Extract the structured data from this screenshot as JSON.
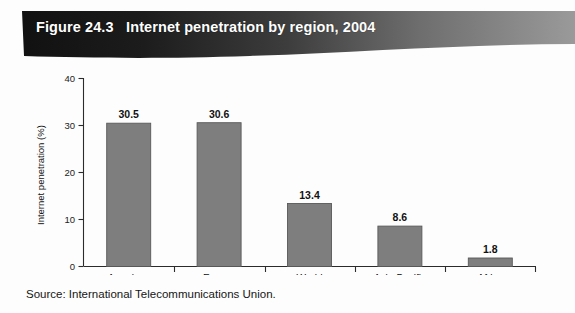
{
  "figure": {
    "banner_title": "Figure 24.3   Internet penetration by region, 2004",
    "source_note": "Source: International Telecommunications Union.",
    "banner_color_dark": "#171717",
    "banner_color_light": "#8e8e8e",
    "bar_fill": "#7f7e7f",
    "bar_stroke": "#5a595a",
    "axis_color": "#2b2b2b",
    "page_background": "#fdfdfd"
  },
  "chart_data": {
    "type": "bar",
    "title": "Internet penetration by region, 2004",
    "categories": [
      "Americas",
      "Europe",
      "World",
      "Asia-Pacific",
      "Africa"
    ],
    "values": [
      30.5,
      30.6,
      13.4,
      8.6,
      1.8
    ],
    "value_labels": [
      "30.5",
      "30.6",
      "13.4",
      "8.6",
      "1.8"
    ],
    "xlabel": "",
    "ylabel": "Internet penetration (%)",
    "ylim": [
      0,
      40
    ],
    "yticks": [
      0,
      10,
      20,
      30,
      40
    ],
    "ytick_labels": [
      "0",
      "10",
      "20",
      "30",
      "40"
    ],
    "grid": false,
    "legend": false
  }
}
